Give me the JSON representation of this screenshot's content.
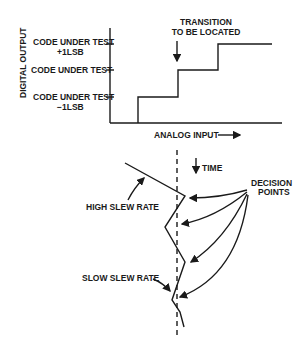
{
  "top_chart": {
    "y_axis_label": "DIGITAL OUTPUT",
    "x_axis_label": "ANALOG INPUT",
    "levels": [
      {
        "line1": "CODE UNDER TEST",
        "line2": "+1LSB"
      },
      {
        "line1": "CODE UNDER TEST",
        "line2": ""
      },
      {
        "line1": "CODE UNDER TEST",
        "line2": "−1LSB"
      }
    ],
    "annotation_line1": "TRANSITION",
    "annotation_line2": "TO BE LOCATED"
  },
  "bottom_diagram": {
    "time_label": "TIME",
    "high_slew_label": "HIGH SLEW RATE",
    "slow_slew_label": "SLOW SLEW RATE",
    "decision_line1": "DECISION",
    "decision_line2": "POINTS"
  },
  "colors": {
    "ink": "#1a1a1a",
    "background": "#ffffff"
  }
}
